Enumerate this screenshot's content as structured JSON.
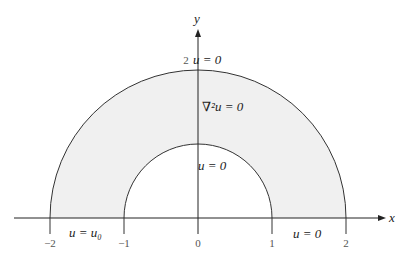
{
  "diagram": {
    "axes": {
      "x_label": "x",
      "y_label": "y"
    },
    "ticks": [
      {
        "label": "−2",
        "value": -2
      },
      {
        "label": "−1",
        "value": -1
      },
      {
        "label": "0",
        "value": 0
      },
      {
        "label": "1",
        "value": 1
      },
      {
        "label": "2",
        "value": 2
      }
    ],
    "y_tick": "2",
    "labels": {
      "outer_bc": "u = 0",
      "pde": "∇²u = 0",
      "inner_bc": "u = 0",
      "left_bc": "u = u₀",
      "right_bc": "u = 0"
    },
    "region": {
      "inner_radius": 1,
      "outer_radius": 2,
      "fill": "#f0f0f0",
      "stroke": "#333333"
    }
  }
}
